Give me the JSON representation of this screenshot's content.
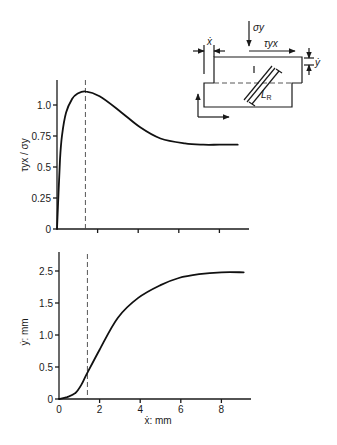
{
  "chart_data": [
    {
      "type": "line",
      "title": "",
      "xlabel": "",
      "ylabel": "τyx / σy",
      "xlim": [
        0,
        9.5
      ],
      "ylim": [
        0,
        1.2
      ],
      "grid": false,
      "x_ticks": [
        2,
        4,
        6,
        8
      ],
      "x_tick_labels": [],
      "y_ticks": [
        0,
        0.25,
        0.5,
        0.75,
        1.0
      ],
      "y_tick_labels": [
        "0",
        "0.25",
        "0.5",
        "0.75",
        "1.0"
      ],
      "vline_x": 1.4,
      "series": [
        {
          "name": "τyx/σy",
          "x": [
            0,
            0.15,
            0.25,
            0.45,
            0.75,
            1.0,
            1.4,
            2.1,
            3.1,
            4.1,
            5.1,
            6.3,
            7.2,
            8.0,
            8.9
          ],
          "y": [
            0,
            0.56,
            0.76,
            0.94,
            1.05,
            1.09,
            1.11,
            1.07,
            0.95,
            0.82,
            0.73,
            0.69,
            0.68,
            0.68,
            0.68
          ]
        }
      ]
    },
    {
      "type": "line",
      "title": "",
      "xlabel": "ẋ: mm",
      "ylabel": "ẏ: mm",
      "xlim": [
        0,
        9.5
      ],
      "ylim": [
        0,
        2.3
      ],
      "grid": false,
      "x_ticks": [
        0,
        2,
        4,
        6,
        8
      ],
      "x_tick_labels": [
        "0",
        "2",
        "4",
        "6",
        "8"
      ],
      "y_ticks": [
        0,
        0.5,
        1.0,
        1.5,
        2.0
      ],
      "y_tick_labels": [
        "0",
        "0.5",
        "1.0",
        "1.5",
        "2.5"
      ],
      "vline_x": 1.4,
      "series": [
        {
          "name": "ẏ",
          "x": [
            0,
            0.4,
            0.8,
            1.1,
            1.35,
            2.0,
            2.9,
            3.9,
            5.0,
            5.9,
            6.9,
            8.0,
            9.1
          ],
          "y": [
            0,
            0.03,
            0.09,
            0.22,
            0.38,
            0.77,
            1.27,
            1.58,
            1.78,
            1.89,
            1.95,
            1.98,
            1.98
          ]
        }
      ]
    }
  ],
  "diagram": {
    "labels": {
      "normal_stress": "σy",
      "shear_stress": "τyx",
      "x_disp": "ẋ",
      "y_disp": "ẏ",
      "band_length_main": "L",
      "band_length_sub": "R"
    }
  }
}
